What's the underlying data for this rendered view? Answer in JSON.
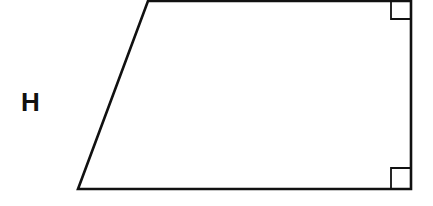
{
  "diagram": {
    "shape": "right-trapezoid",
    "stroke_color": "#111111",
    "background": "#ffffff",
    "label": "H",
    "vertices": {
      "top_left": [
        148,
        1
      ],
      "top_right": [
        411,
        1
      ],
      "bottom_right": [
        411,
        189
      ],
      "bottom_left": [
        78,
        189
      ]
    },
    "right_angle_markers": [
      "top-right",
      "bottom-right"
    ]
  }
}
